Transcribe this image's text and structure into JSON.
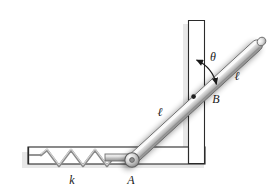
{
  "figure": {
    "type": "mechanics-diagram",
    "width": 277,
    "height": 195,
    "background_color": "#ffffff",
    "labels": {
      "spring_stiffness": "k",
      "pin_a": "A",
      "pin_b": "B",
      "angle": "θ",
      "length_lower": "ℓ",
      "length_upper": "ℓ"
    },
    "colors": {
      "outline": "#2b2b2b",
      "bar_light": "#e8e8e8",
      "bar_mid": "#b9b9b9",
      "bar_dark": "#8f8f8f",
      "wall_fill": "#ffffff",
      "shadow": "#c9c9c9",
      "label_color": "#1a1a1a",
      "spring_color": "#6f6f6f"
    },
    "parts": {
      "vertical_wall": "vertical-channel-wall",
      "horizontal_wall": "horizontal-channel-wall",
      "spring": "coil-spring",
      "bar": "inclined-rigid-bar",
      "pin_joint_a": "pin-joint-a",
      "pin_joint_b": "pin-joint-b",
      "angle_arc": "angle-arc-theta"
    },
    "spring": {
      "coils": 6,
      "x_start": 40,
      "x_end": 113,
      "y_center": 158,
      "amplitude": 8
    },
    "geometry": {
      "bar_start": [
        132,
        160
      ],
      "bar_end": [
        262,
        41
      ],
      "pin_a": [
        132,
        160
      ],
      "pin_b": [
        194,
        97
      ],
      "angle_value_deg": null
    }
  }
}
